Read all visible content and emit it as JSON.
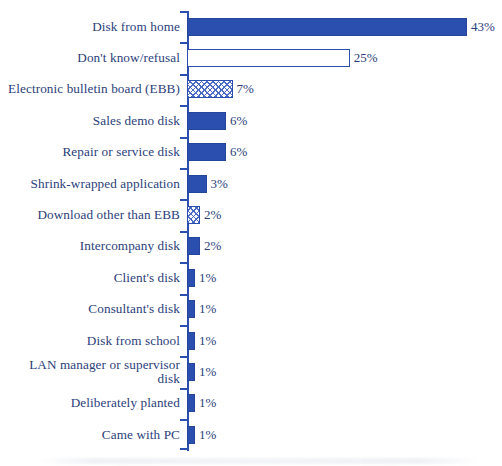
{
  "chart_data": {
    "type": "bar",
    "orientation": "horizontal",
    "title": "",
    "subtitle": "",
    "xlabel": "",
    "ylabel": "",
    "xlim": [
      0,
      43
    ],
    "grid": false,
    "legend": null,
    "axis_tick_labels": [],
    "value_suffix": "%",
    "categories": [
      "Disk from home",
      "Don't know/refusal",
      "Electronic bulletin board (EBB)",
      "Sales demo disk",
      "Repair or service disk",
      "Shrink-wrapped application",
      "Download other than EBB",
      "Intercompany disk",
      "Client's disk",
      "Consultant's disk",
      "Disk from school",
      "LAN manager or supervisor\ndisk",
      "Deliberately planted",
      "Came with PC"
    ],
    "values": [
      43,
      25,
      7,
      6,
      6,
      3,
      2,
      2,
      1,
      1,
      1,
      1,
      1,
      1
    ],
    "value_labels": [
      "43%",
      "25%",
      "7%",
      "6%",
      "6%",
      "3%",
      "2%",
      "2%",
      "1%",
      "1%",
      "1%",
      "1%",
      "1%",
      "1%"
    ],
    "bar_styles": [
      "solid",
      "hollow",
      "hatch",
      "solid",
      "solid",
      "solid",
      "hatch",
      "solid",
      "solid",
      "solid",
      "solid",
      "solid",
      "solid",
      "solid"
    ],
    "colors": {
      "bar_fill": "#2a4faf",
      "bar_outline": "#2a4faf",
      "hatch_line": "#4a6bc4",
      "hollow_fill": "#ffffff",
      "text": "#2b3e7a",
      "axis": "#2a4faf",
      "background": "#ffffff"
    }
  }
}
